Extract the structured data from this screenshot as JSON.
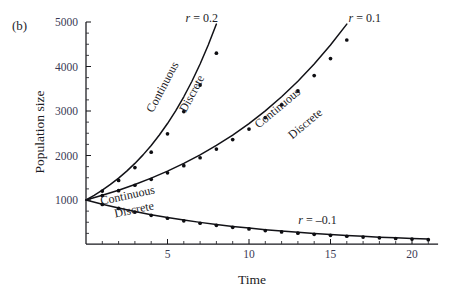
{
  "panel": {
    "label": "(b)"
  },
  "chart_data": {
    "type": "line",
    "title": "",
    "xlabel": "Time",
    "ylabel": "Population size",
    "xlim": [
      0,
      21.6
    ],
    "ylim": [
      0,
      5000
    ],
    "grid": false,
    "legend_position": "inline-annotations",
    "x_ticks_major": [
      5,
      10,
      15,
      20
    ],
    "x_ticks_major_labels": [
      "5",
      "10",
      "15",
      "20"
    ],
    "x_ticks_minor_step": 1,
    "y_ticks_major": [
      1000,
      2000,
      3000,
      4000,
      5000
    ],
    "y_ticks_major_labels": [
      "1000",
      "2000",
      "3000",
      "4000",
      "5000"
    ],
    "y_ticks_minor_step": 250,
    "initial_population": 1000,
    "annotations": [
      {
        "name": "r-positive-02",
        "text": "r = 0.2",
        "x": 7.1,
        "y": 5000
      },
      {
        "name": "r-positive-01",
        "text": "r = 0.1",
        "x": 17.1,
        "y": 5000
      },
      {
        "name": "r-negative-01",
        "text": "r = –0.1",
        "x": 14.2,
        "y": 450
      },
      {
        "name": "continuous-r02",
        "text": "Continuous",
        "x": 4.9,
        "y": 3500,
        "rotation": -62
      },
      {
        "name": "discrete-r02",
        "text": "Discrete",
        "x": 6.7,
        "y": 3350,
        "rotation": -62
      },
      {
        "name": "continuous-r01",
        "text": "Continuous",
        "x": 11.9,
        "y": 3000,
        "rotation": -40
      },
      {
        "name": "discrete-r01",
        "text": "Discrete",
        "x": 13.6,
        "y": 2650,
        "rotation": -40
      },
      {
        "name": "continuous-rneg",
        "text": "Continuous",
        "x": 2.6,
        "y": 1020,
        "rotation": -12
      },
      {
        "name": "discrete-rneg",
        "text": "Discrete",
        "x": 3.0,
        "y": 700,
        "rotation": -12
      }
    ],
    "series": [
      {
        "name": "Continuous r = 0.2",
        "rate": 0.2,
        "model": "continuous",
        "style": "curve",
        "x": [
          0,
          0.5,
          1,
          1.5,
          2,
          2.5,
          3,
          3.5,
          4,
          4.5,
          5,
          5.5,
          6,
          6.5,
          7,
          7.5,
          8,
          8.5
        ],
        "values": [
          1000,
          1105,
          1221,
          1350,
          1492,
          1649,
          1822,
          2014,
          2226,
          2460,
          2718,
          3004,
          3320,
          3669,
          4055,
          4482,
          4953,
          5474
        ]
      },
      {
        "name": "Discrete r = 0.2",
        "rate": 0.2,
        "model": "discrete",
        "style": "points",
        "x": [
          0,
          1,
          2,
          3,
          4,
          5,
          6,
          7,
          8
        ],
        "values": [
          1000,
          1200,
          1440,
          1728,
          2074,
          2488,
          2986,
          3583,
          4300
        ]
      },
      {
        "name": "Continuous r = 0.1",
        "rate": 0.1,
        "model": "continuous",
        "style": "curve",
        "x": [
          0,
          1,
          2,
          3,
          4,
          5,
          6,
          7,
          8,
          9,
          10,
          11,
          12,
          13,
          14,
          15,
          16,
          16.8
        ],
        "values": [
          1000,
          1105,
          1221,
          1350,
          1492,
          1649,
          1822,
          2014,
          2226,
          2460,
          2718,
          3004,
          3320,
          3669,
          4055,
          4482,
          4953,
          5339
        ]
      },
      {
        "name": "Discrete r = 0.1",
        "rate": 0.1,
        "model": "discrete",
        "style": "points",
        "x": [
          0,
          1,
          2,
          3,
          4,
          5,
          6,
          7,
          8,
          9,
          10,
          11,
          12,
          13,
          14,
          15,
          16
        ],
        "values": [
          1000,
          1100,
          1210,
          1331,
          1464,
          1611,
          1772,
          1949,
          2144,
          2358,
          2594,
          2853,
          3138,
          3452,
          3797,
          4177,
          4595
        ]
      },
      {
        "name": "Continuous r = -0.1",
        "rate": -0.1,
        "model": "continuous",
        "style": "curve",
        "x": [
          0,
          1,
          2,
          3,
          4,
          5,
          6,
          7,
          8,
          9,
          10,
          11,
          12,
          13,
          14,
          15,
          16,
          17,
          18,
          19,
          20,
          21
        ],
        "values": [
          1000,
          905,
          819,
          741,
          670,
          607,
          549,
          497,
          449,
          407,
          368,
          333,
          301,
          273,
          247,
          223,
          202,
          183,
          165,
          150,
          135,
          122
        ]
      },
      {
        "name": "Discrete r = -0.1",
        "rate": -0.1,
        "model": "discrete",
        "style": "points",
        "x": [
          0,
          1,
          2,
          3,
          4,
          5,
          6,
          7,
          8,
          9,
          10,
          11,
          12,
          13,
          14,
          15,
          16,
          17,
          18,
          19,
          20,
          21
        ],
        "values": [
          1000,
          900,
          810,
          729,
          656,
          590,
          531,
          478,
          430,
          387,
          349,
          314,
          282,
          254,
          229,
          206,
          185,
          167,
          150,
          135,
          122,
          109
        ]
      }
    ]
  },
  "colors": {
    "curve": "#121217",
    "point": "#0e0e12",
    "axis": "#17171c",
    "tick_label": "#3a3a55",
    "text": "#1b1b24",
    "background": "#ffffff"
  }
}
